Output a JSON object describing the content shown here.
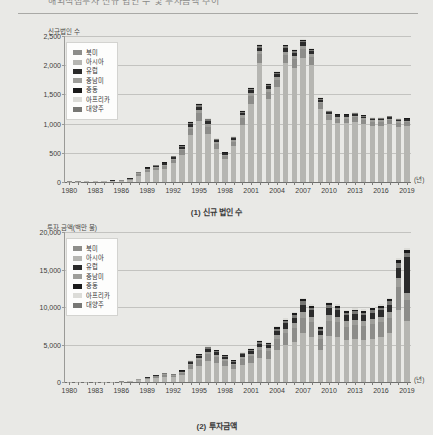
{
  "document": {
    "title": "해외직접투자 신규 법인 수 및 투자금액 추이"
  },
  "legend": {
    "items": [
      {
        "label": "북미",
        "color": "#8d8d8a"
      },
      {
        "label": "아시아",
        "color": "#b6b6b2"
      },
      {
        "label": "유럽",
        "color": "#2b2b2b"
      },
      {
        "label": "중남미",
        "color": "#9e9e9a"
      },
      {
        "label": "중동",
        "color": "#1a1a1a"
      },
      {
        "label": "아프리카",
        "color": "#dcdcd8"
      },
      {
        "label": "대양주",
        "color": "#777774"
      }
    ]
  },
  "charts": [
    {
      "id": "chart1",
      "caption": "(1) 신규 법인 수",
      "axis_title": "신규법인 수",
      "xunit": "(년)"
    },
    {
      "id": "chart2",
      "caption": "(2) 투자금액",
      "axis_title": "투자 금액(백만 불)",
      "xunit": "(년)"
    }
  ],
  "chart_data": [
    {
      "type": "bar",
      "title": "(1) 신규 법인 수",
      "subtitle": "신규법인 수",
      "xlabel": "(년)",
      "ylabel": "신규법인 수",
      "stacked": true,
      "grid": true,
      "legend_position": "top-left",
      "ylim": [
        0,
        2500
      ],
      "yticks": [
        0,
        500,
        1000,
        1500,
        2000,
        2500
      ],
      "ytick_labels": [
        "0",
        "500",
        "1,000",
        "1,500",
        "2,000",
        "2,500"
      ],
      "categories": [
        "1980",
        "1981",
        "1982",
        "1983",
        "1984",
        "1985",
        "1986",
        "1987",
        "1988",
        "1989",
        "1990",
        "1991",
        "1992",
        "1993",
        "1994",
        "1995",
        "1996",
        "1997",
        "1998",
        "1999",
        "2000",
        "2001",
        "2002",
        "2003",
        "2004",
        "2005",
        "2006",
        "2007",
        "2008",
        "2009",
        "2010",
        "2011",
        "2012",
        "2013",
        "2014",
        "2015",
        "2016",
        "2017",
        "2018",
        "2019"
      ],
      "xtick_labels": [
        "1980",
        "1983",
        "1986",
        "1989",
        "1992",
        "1995",
        "1998",
        "2001",
        "2004",
        "2007",
        "2010",
        "2013",
        "2016",
        "2019"
      ],
      "series": [
        {
          "name": "아시아",
          "color": "#b6b6b2",
          "values": [
            8,
            7,
            9,
            11,
            14,
            16,
            22,
            40,
            110,
            170,
            200,
            230,
            320,
            470,
            800,
            1040,
            830,
            570,
            390,
            610,
            980,
            1330,
            2040,
            1430,
            1620,
            2030,
            1960,
            2130,
            2000,
            1250,
            1060,
            1010,
            1010,
            1030,
            1000,
            960,
            960,
            990,
            950,
            960
          ]
        },
        {
          "name": "북미",
          "color": "#8d8d8a",
          "values": [
            2,
            2,
            3,
            4,
            5,
            7,
            9,
            14,
            30,
            40,
            45,
            50,
            60,
            75,
            110,
            140,
            120,
            80,
            55,
            80,
            120,
            140,
            150,
            120,
            130,
            150,
            145,
            150,
            140,
            95,
            80,
            75,
            75,
            75,
            70,
            70,
            70,
            70,
            65,
            65
          ]
        },
        {
          "name": "중남미",
          "color": "#9e9e9a",
          "values": [
            1,
            1,
            1,
            1,
            2,
            2,
            3,
            5,
            10,
            14,
            16,
            18,
            22,
            28,
            40,
            50,
            45,
            30,
            20,
            28,
            40,
            48,
            50,
            42,
            45,
            52,
            50,
            52,
            48,
            32,
            28,
            26,
            26,
            26,
            24,
            24,
            24,
            24,
            22,
            22
          ]
        },
        {
          "name": "유럽",
          "color": "#2b2b2b",
          "values": [
            1,
            1,
            1,
            2,
            2,
            3,
            4,
            6,
            12,
            16,
            18,
            20,
            26,
            32,
            46,
            58,
            52,
            34,
            24,
            32,
            46,
            55,
            58,
            48,
            52,
            60,
            58,
            60,
            55,
            36,
            32,
            30,
            30,
            30,
            28,
            28,
            28,
            28,
            26,
            26
          ]
        },
        {
          "name": "대양주",
          "color": "#777774",
          "values": [
            0,
            0,
            1,
            1,
            1,
            1,
            2,
            3,
            6,
            8,
            9,
            10,
            12,
            16,
            22,
            28,
            25,
            16,
            11,
            15,
            22,
            26,
            28,
            23,
            25,
            29,
            28,
            29,
            26,
            17,
            15,
            14,
            14,
            14,
            13,
            13,
            13,
            13,
            12,
            12
          ]
        },
        {
          "name": "중동",
          "color": "#1a1a1a",
          "values": [
            0,
            0,
            0,
            0,
            1,
            1,
            1,
            2,
            4,
            5,
            6,
            7,
            8,
            10,
            14,
            18,
            16,
            10,
            7,
            10,
            14,
            17,
            18,
            15,
            16,
            19,
            18,
            19,
            17,
            11,
            10,
            9,
            9,
            9,
            8,
            8,
            8,
            8,
            8,
            8
          ]
        },
        {
          "name": "아프리카",
          "color": "#dcdcd8",
          "values": [
            0,
            0,
            0,
            0,
            0,
            1,
            1,
            1,
            3,
            4,
            4,
            5,
            6,
            8,
            11,
            14,
            12,
            8,
            6,
            8,
            11,
            13,
            14,
            12,
            13,
            15,
            14,
            15,
            13,
            9,
            8,
            7,
            7,
            7,
            7,
            7,
            7,
            7,
            6,
            6
          ]
        }
      ],
      "totals": [
        12,
        11,
        15,
        19,
        25,
        31,
        42,
        71,
        175,
        257,
        298,
        340,
        454,
        639,
        1043,
        1348,
        1100,
        748,
        513,
        783,
        1233,
        1629,
        2358,
        1690,
        1901,
        2355,
        2273,
        2455,
        2299,
        1450,
        1233,
        1171,
        1171,
        1191,
        1150,
        1110,
        1110,
        1140,
        1089,
        1099
      ]
    },
    {
      "type": "bar",
      "title": "(2) 투자금액",
      "subtitle": "투자 금액(백만 불)",
      "xlabel": "(년)",
      "ylabel": "투자 금액(백만 불)",
      "stacked": true,
      "grid": true,
      "legend_position": "top-left",
      "ylim": [
        0,
        20000
      ],
      "yticks": [
        0,
        5000,
        10000,
        15000,
        20000
      ],
      "ytick_labels": [
        "0",
        "5,000",
        "10,000",
        "15,000",
        "20,000"
      ],
      "categories": [
        "1980",
        "1981",
        "1982",
        "1983",
        "1984",
        "1985",
        "1986",
        "1987",
        "1988",
        "1989",
        "1990",
        "1991",
        "1992",
        "1993",
        "1994",
        "1995",
        "1996",
        "1997",
        "1998",
        "1999",
        "2000",
        "2001",
        "2002",
        "2003",
        "2004",
        "2005",
        "2006",
        "2007",
        "2008",
        "2009",
        "2010",
        "2011",
        "2012",
        "2013",
        "2014",
        "2015",
        "2016",
        "2017",
        "2018",
        "2019"
      ],
      "xtick_labels": [
        "1980",
        "1983",
        "1986",
        "1989",
        "1992",
        "1995",
        "1998",
        "2001",
        "2004",
        "2007",
        "2010",
        "2013",
        "2016",
        "2019"
      ],
      "series": [
        {
          "name": "아시아",
          "color": "#b6b6b2",
          "values": [
            15,
            18,
            22,
            26,
            30,
            40,
            55,
            110,
            240,
            380,
            560,
            700,
            620,
            920,
            1680,
            2200,
            2800,
            2500,
            2100,
            1700,
            2300,
            2600,
            3200,
            3100,
            4300,
            4900,
            5400,
            6500,
            6000,
            4300,
            6200,
            6000,
            5600,
            5700,
            5600,
            5800,
            6000,
            6500,
            9600,
            8200
          ]
        },
        {
          "name": "북미",
          "color": "#8d8d8a",
          "values": [
            5,
            6,
            7,
            8,
            10,
            14,
            18,
            35,
            80,
            130,
            190,
            240,
            210,
            300,
            540,
            700,
            900,
            800,
            680,
            560,
            760,
            860,
            1050,
            1000,
            1400,
            1600,
            1750,
            2100,
            1950,
            1400,
            2000,
            1950,
            1800,
            1850,
            1820,
            1880,
            1950,
            2100,
            3100,
            2700
          ]
        },
        {
          "name": "중남미",
          "color": "#9e9e9a",
          "values": [
            2,
            2,
            3,
            3,
            4,
            5,
            7,
            13,
            30,
            50,
            72,
            90,
            80,
            115,
            205,
            265,
            340,
            305,
            260,
            210,
            290,
            325,
            400,
            380,
            530,
            610,
            665,
            800,
            740,
            530,
            760,
            740,
            685,
            700,
            690,
            715,
            740,
            800,
            1180,
            1030
          ]
        },
        {
          "name": "유럽",
          "color": "#2b2b2b",
          "values": [
            2,
            3,
            3,
            4,
            5,
            6,
            8,
            16,
            36,
            58,
            84,
            105,
            94,
            135,
            240,
            310,
            400,
            360,
            300,
            245,
            335,
            380,
            465,
            445,
            620,
            710,
            780,
            935,
            865,
            620,
            890,
            865,
            800,
            820,
            805,
            835,
            865,
            935,
            1380,
            4800
          ]
        },
        {
          "name": "대양주",
          "color": "#777774",
          "values": [
            1,
            1,
            1,
            2,
            2,
            3,
            4,
            7,
            16,
            25,
            37,
            46,
            41,
            59,
            105,
            136,
            175,
            157,
            131,
            107,
            147,
            166,
            203,
            194,
            270,
            310,
            341,
            409,
            378,
            271,
            389,
            378,
            350,
            358,
            352,
            365,
            378,
            409,
            603,
            527
          ]
        },
        {
          "name": "중동",
          "color": "#1a1a1a",
          "values": [
            0,
            1,
            1,
            1,
            1,
            2,
            2,
            5,
            11,
            17,
            25,
            31,
            28,
            40,
            71,
            92,
            118,
            106,
            89,
            73,
            99,
            112,
            137,
            131,
            183,
            210,
            230,
            277,
            256,
            183,
            263,
            256,
            237,
            242,
            238,
            247,
            256,
            277,
            408,
            357
          ]
        },
        {
          "name": "아프리카",
          "color": "#dcdcd8",
          "values": [
            0,
            0,
            1,
            1,
            1,
            1,
            2,
            4,
            8,
            13,
            19,
            24,
            21,
            30,
            54,
            70,
            90,
            81,
            68,
            55,
            76,
            85,
            105,
            100,
            139,
            160,
            175,
            211,
            195,
            139,
            200,
            195,
            180,
            184,
            181,
            188,
            195,
            211,
            311,
            272
          ]
        }
      ],
      "totals": [
        25,
        31,
        38,
        45,
        53,
        71,
        96,
        190,
        421,
        673,
        987,
        1236,
        1094,
        1599,
        2895,
        3773,
        4823,
        4309,
        3628,
        2950,
        4007,
        4528,
        5560,
        5350,
        7442,
        8500,
        9341,
        11232,
        10384,
        7443,
        10702,
        10384,
        9652,
        9854,
        9686,
        10030,
        10384,
        11232,
        16582,
        17886
      ]
    }
  ]
}
